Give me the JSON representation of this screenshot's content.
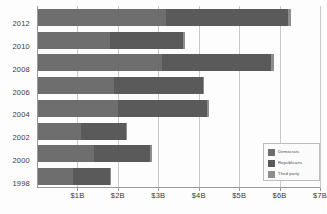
{
  "chart_data": {
    "type": "bar",
    "orientation": "horizontal",
    "stacked": true,
    "title": "",
    "subtitle": "",
    "xlabel": "",
    "ylabel": "",
    "xlim": [
      0,
      7
    ],
    "xtick_values": [
      1,
      2,
      3,
      4,
      5,
      6,
      7
    ],
    "xtick_labels": [
      "$1B",
      "$2B",
      "$3B",
      "$4B",
      "$5B",
      "$6B",
      "$7B"
    ],
    "unit": "billions of US dollars",
    "grid": true,
    "grid_axis": "x",
    "legend_position": "bottom-right",
    "categories": [
      "2012",
      "2010",
      "2008",
      "2006",
      "2004",
      "2002",
      "2000",
      "1998"
    ],
    "series": [
      {
        "name": "Democrats",
        "color": "#6e6e6e",
        "values": [
          3.2,
          1.8,
          3.1,
          1.9,
          2.0,
          1.1,
          1.4,
          0.9
        ]
      },
      {
        "name": "Republicans",
        "color": "#5a5a5a",
        "values": [
          3.0,
          1.8,
          2.7,
          2.2,
          2.2,
          1.1,
          1.4,
          0.9
        ]
      },
      {
        "name": "Third party",
        "color": "#8e8e8e",
        "values": [
          0.08,
          0.05,
          0.07,
          0.04,
          0.05,
          0.03,
          0.04,
          0.02
        ]
      }
    ],
    "totals": [
      6.28,
      3.65,
      5.87,
      4.14,
      4.25,
      2.23,
      2.84,
      1.82
    ]
  },
  "legend": {
    "items": [
      {
        "label": "Democrats",
        "color": "#6e6e6e"
      },
      {
        "label": "Republicans",
        "color": "#5a5a5a"
      },
      {
        "label": "Third party",
        "color": "#8e8e8e"
      }
    ]
  }
}
